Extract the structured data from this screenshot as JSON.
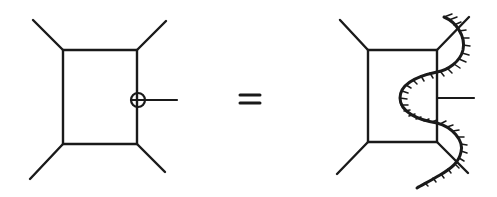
{
  "diagram": {
    "type": "feynman-diagram-equation",
    "operator": "=",
    "left": {
      "description": "box diagram with four external legs and an operator insertion (circle) on the right vertical edge, with an external stub line",
      "box": {
        "x1": 63,
        "y1": 50,
        "x2": 137,
        "y2": 144
      },
      "legs": [
        {
          "name": "top-left",
          "from": [
            63,
            50
          ],
          "to": [
            33,
            20
          ]
        },
        {
          "name": "top-right",
          "from": [
            137,
            50
          ],
          "to": [
            166,
            21
          ]
        },
        {
          "name": "bottom-left",
          "from": [
            63,
            144
          ],
          "to": [
            30,
            179
          ]
        },
        {
          "name": "bottom-right",
          "from": [
            137,
            144
          ],
          "to": [
            165,
            172
          ]
        }
      ],
      "insertion": {
        "cx": 138,
        "cy": 100,
        "r": 7,
        "symbol": "circle-with-cross"
      },
      "stub": {
        "from": [
          138,
          100
        ],
        "to": [
          177,
          100
        ]
      }
    },
    "right": {
      "description": "same box diagram with the insertion replaced by a hatched wavy cut line crossing the right side",
      "box": {
        "x1": 368,
        "y1": 50,
        "x2": 437,
        "y2": 142
      },
      "legs": [
        {
          "name": "top-left",
          "from": [
            368,
            50
          ],
          "to": [
            340,
            20
          ]
        },
        {
          "name": "top-right",
          "from": [
            437,
            50
          ],
          "to": [
            469,
            17
          ]
        },
        {
          "name": "bottom-left",
          "from": [
            368,
            142
          ],
          "to": [
            337,
            174
          ]
        },
        {
          "name": "bottom-right",
          "from": [
            437,
            142
          ],
          "to": [
            468,
            173
          ]
        }
      ],
      "stub": {
        "from": [
          437,
          98
        ],
        "to": [
          474,
          98
        ]
      },
      "cut_line": "hatched-wavy-curve"
    },
    "equals": {
      "x1": 240,
      "x2": 260,
      "y_top": 95,
      "y_bottom": 103
    }
  }
}
